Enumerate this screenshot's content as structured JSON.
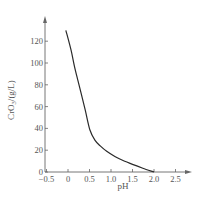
{
  "chart_data": {
    "type": "line",
    "title": "",
    "xlabel": "pH",
    "ylabel": "CrO3/(g/L)",
    "ylabel_parts": {
      "base": "CrO",
      "sub": "3",
      "rest": "/(g/L)"
    },
    "xlim": [
      -0.5,
      2.5
    ],
    "ylim": [
      0,
      130
    ],
    "xticks": [
      -0.5,
      0,
      0.5,
      1.0,
      1.5,
      2.0,
      2.5
    ],
    "xtick_labels": [
      "−0.5",
      "0",
      "0.5",
      "1.0",
      "1.5",
      "2.0",
      "2.5"
    ],
    "yticks": [
      0,
      20,
      40,
      60,
      80,
      100,
      120
    ],
    "ytick_labels": [
      "0",
      "20",
      "40",
      "60",
      "80",
      "100",
      "120"
    ],
    "grid": false,
    "legend": null,
    "series": [
      {
        "name": "CrO3",
        "x": [
          -0.05,
          0.07,
          0.15,
          0.23,
          0.3,
          0.4,
          0.51,
          0.63,
          0.75,
          0.9,
          1.1,
          1.28,
          1.5,
          1.74,
          2.0
        ],
        "y": [
          130,
          112,
          97,
          84,
          73,
          57,
          38.5,
          29,
          24,
          19,
          14,
          10.5,
          7,
          3.5,
          0
        ]
      }
    ]
  }
}
